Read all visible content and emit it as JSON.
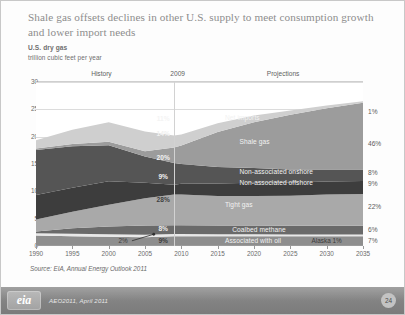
{
  "slide": {
    "title": "Shale gas offsets declines in other U.S. supply to meet consumption growth and lower import needs",
    "subtitle": "U.S. dry gas",
    "units": "trillion cubic feet per year",
    "source": "Source:  EIA, Annual Energy Outlook 2011"
  },
  "footer": {
    "logo": "eia",
    "text": "AEO2011, April 2011",
    "page": "24"
  },
  "regions": {
    "history": "History",
    "marker": "2009",
    "projections": "Projections"
  },
  "chart_data": {
    "type": "area",
    "title": "Shale gas offsets declines in other U.S. supply to meet consumption growth and lower import needs",
    "subtitle": "U.S. dry gas",
    "xlabel": "",
    "ylabel": "trillion cubic feet per year",
    "ylim": [
      0,
      30
    ],
    "xlim": [
      1990,
      2035
    ],
    "grid": true,
    "legend_position": "in-plot-labels",
    "yticks": [
      "0",
      "5",
      "10",
      "15",
      "20",
      "25",
      "30"
    ],
    "xticks": [
      "1990",
      "1995",
      "2000",
      "2005",
      "2010",
      "2015",
      "2020",
      "2025",
      "2030",
      "2035"
    ],
    "x": [
      1990,
      1995,
      2000,
      2005,
      2009,
      2010,
      2015,
      2020,
      2025,
      2030,
      2035
    ],
    "stack_order_bottom_to_top": [
      "Associated with oil",
      "Alaska",
      "Coalbed methane",
      "Tight gas",
      "Non-associated offshore",
      "Non-associated onshore",
      "Shale gas",
      "Net imports"
    ],
    "series": [
      {
        "name": "Associated with oil",
        "values": [
          1.9,
          1.8,
          1.7,
          1.6,
          1.8,
          1.8,
          1.8,
          1.8,
          1.8,
          1.8,
          1.8
        ],
        "share_2009": "9%",
        "share_2035": "7%",
        "color": "#8e8e8e"
      },
      {
        "name": "Alaska",
        "values": [
          0.45,
          0.45,
          0.45,
          0.45,
          0.4,
          0.4,
          0.35,
          0.35,
          0.3,
          0.3,
          0.3
        ],
        "share_2009": "2%",
        "share_2035": "1%",
        "color": "#e8e8e8"
      },
      {
        "name": "Coalbed methane",
        "values": [
          0.3,
          1.0,
          1.4,
          1.7,
          1.6,
          1.6,
          1.6,
          1.6,
          1.6,
          1.6,
          1.6
        ],
        "share_2009": "8%",
        "share_2035": "6%",
        "color": "#6a6a6a"
      },
      {
        "name": "Tight gas",
        "values": [
          2.2,
          3.0,
          4.0,
          5.0,
          5.6,
          5.6,
          5.4,
          5.4,
          5.5,
          5.7,
          5.8
        ],
        "share_2009": "28%",
        "share_2035": "22%",
        "color": "#a9a9a9"
      },
      {
        "name": "Non-associated offshore",
        "values": [
          4.5,
          4.4,
          4.3,
          2.8,
          1.8,
          2.0,
          2.3,
          2.4,
          2.4,
          2.4,
          2.4
        ],
        "share_2009": "9%",
        "share_2035": "9%",
        "color": "#3d3d3d"
      },
      {
        "name": "Non-associated onshore",
        "values": [
          8.2,
          7.6,
          6.6,
          4.8,
          4.0,
          3.6,
          3.0,
          2.7,
          2.4,
          2.2,
          2.1
        ],
        "share_2009": "20%",
        "share_2035": "8%",
        "color": "#555555"
      },
      {
        "name": "Shale gas",
        "values": [
          0.3,
          0.4,
          0.6,
          1.0,
          2.8,
          3.4,
          6.4,
          8.4,
          10.0,
          11.2,
          12.2
        ],
        "share_2009": "14%",
        "share_2035": "46%",
        "color": "#9c9c9c"
      },
      {
        "name": "Net imports",
        "values": [
          1.5,
          2.6,
          3.6,
          3.6,
          2.2,
          2.0,
          1.6,
          1.2,
          0.8,
          0.5,
          0.3
        ],
        "share_2009": "11%",
        "share_2035": "1%",
        "color": "#cfcfcf"
      }
    ],
    "labels_in_plot": [
      {
        "text": "Net imports",
        "x_year": 2016,
        "y_value": 23.5
      },
      {
        "text": "Shale gas",
        "x_year": 2018,
        "y_value": 19.0
      },
      {
        "text": "Non-associated onshore",
        "x_year": 2018,
        "y_value": 13.6
      },
      {
        "text": "Non-associated offshore",
        "x_year": 2018,
        "y_value": 11.5
      },
      {
        "text": "Tight gas",
        "x_year": 2016,
        "y_value": 7.5
      },
      {
        "text": "Coalbed methane",
        "x_year": 2017,
        "y_value": 3.0
      },
      {
        "text": "Associated with oil",
        "x_year": 2016,
        "y_value": 1.0
      }
    ],
    "annotations": [
      {
        "text": "2%",
        "x_year": 2002,
        "y_value": 0.9,
        "note": "Alaska share in 2009 with leader line"
      },
      {
        "text": "Alaska  1%",
        "x_year": 2030,
        "y_value": 1.0,
        "note": "Alaska share in 2035 with leader lines"
      }
    ],
    "share_labels_2009": [
      "11%",
      "14%",
      "20%",
      "9%",
      "28%",
      "8%",
      "9%"
    ],
    "share_labels_2035": [
      "1%",
      "46%",
      "8%",
      "9%",
      "22%",
      "6%",
      "7%"
    ]
  }
}
